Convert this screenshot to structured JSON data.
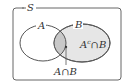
{
  "diagram": {
    "type": "venn",
    "universe_label": "S",
    "sets": [
      {
        "label": "A"
      },
      {
        "label": "B"
      }
    ],
    "regions": [
      {
        "label": "A∩B",
        "shade": "#c8c8c8"
      },
      {
        "label": "A",
        "sup": "c",
        "rest": "∩B",
        "shade": "#e6e6e6"
      }
    ],
    "colors": {
      "stroke": "#555555",
      "intersection": "#c8c8c8",
      "b_only": "#e6e6e6"
    }
  }
}
